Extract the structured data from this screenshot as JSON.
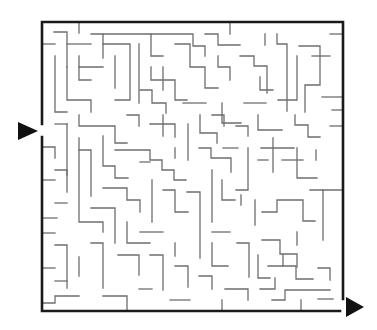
{
  "maze": {
    "title": "",
    "colors": {
      "wall": "#6e6e6e",
      "border": "#1a1a1a",
      "arrow": "#111111",
      "background": "#ffffff"
    },
    "entrance": {
      "icon": "arrow-right-icon",
      "points": "18,122 18,140 38,131"
    },
    "exit": {
      "icon": "arrow-right-icon",
      "points": "346,297 346,317 364,307"
    },
    "border": [
      "M42,124 L42,22 L343,22 L343,299",
      "M42,137 L42,311 L340,311"
    ],
    "walls": [
      "M54,32 L67,32 L67,67",
      "M42,44 L55,44",
      "M79,22 L79,33",
      "M67,44 L91,44",
      "M91,34 L193,34 L193,46 L205,46 L205,56",
      "M103,34 L103,58 M79,67 L103,67",
      "M55,56 L55,112 L67,112",
      "M67,67 L67,100 L91,100 L91,112",
      "M79,56 L79,80 L91,80",
      "M103,44 L130,44 L130,100 L115,100",
      "M115,56 L115,88",
      "M139,44 L139,103",
      "M151,34 L151,56 L163,56",
      "M163,67 L163,90",
      "M151,67 L151,80 L175,80 L175,100 L187,100",
      "M175,44 L190,44 L190,67 L205,67 L205,88 L218,88",
      "M218,56 L218,67 L230,67 L230,80",
      "M205,34 L218,34 L218,45 L240,45",
      "M230,22 L230,34",
      "M240,56 L254,56 L254,66 L267,66 L267,93",
      "M265,34 L265,45",
      "M277,34 L277,44 L287,44 L287,111",
      "M260,77 L260,90 L273,90",
      "M299,46 L320,46 L320,85 L305,85 L305,112",
      "M312,56 L330,56",
      "M330,34 L343,34",
      "M297,56 L297,100 L278,100",
      "M322,97 L343,97",
      "M332,110 L343,110",
      "M222,103 L222,123 L241,123",
      "M183,103 L206,103",
      "M244,103 L266,103",
      "M140,90 L152,90 L152,103 L166,103 L166,113",
      "M55,124 L67,124",
      "M67,124 L67,175",
      "M79,115 L79,126 L115,126 L115,143 L127,143",
      "M103,136 L103,166 L115,166 L115,178 L128,178",
      "M127,115 L139,115 L139,126",
      "M150,124 L175,124 L175,137",
      "M163,115 L163,136",
      "M188,124 L188,160",
      "M200,115 L200,133 L217,133 L217,143",
      "M212,115 L224,115 L224,126",
      "M236,126 L248,126 L248,136",
      "M258,115 L258,130 L282,130",
      "M295,115 L295,125 L308,125 L308,137 L320,137",
      "M330,126 L343,126",
      "M42,147 L55,147 L55,158",
      "M79,150 L91,150 L91,196",
      "M79,138 L79,222 L103,222 L103,232",
      "M55,170 L67,170 L67,192",
      "M103,188 L127,188 L127,200 L140,200 L140,212",
      "M115,150 L150,150 L150,160 L162,160 L162,170 L174,170 L174,180 L186,180",
      "M140,162 L150,162",
      "M199,148 L211,148 L211,158 L231,158 L231,172",
      "M175,148 L175,158",
      "M223,148 L238,148",
      "M248,148 L248,190 L236,190",
      "M261,148 L294,148",
      "M273,138 L273,172",
      "M258,160 L268,160",
      "M297,148 L297,178 L317,178",
      "M282,160 L303,160",
      "M316,160 L316,150",
      "M310,190 L343,190",
      "M42,180 L55,180",
      "M55,203 L67,203",
      "M42,218 L57,218",
      "M91,208 L115,208 L115,243",
      "M127,222 L127,243 L150,243",
      "M140,232 L163,232",
      "M152,180 L152,222",
      "M163,190 L175,190 L175,212 L188,212",
      "M187,192 L200,192 L200,258",
      "M212,170 L212,222",
      "M212,232 L230,232",
      "M222,180 L222,200 L235,200",
      "M241,195 L241,205",
      "M255,200 L255,225",
      "M262,212 L277,212 L277,200 L303,200 L303,221 L315,221",
      "M323,190 L323,240",
      "M297,232 L297,245",
      "M42,233 L55,233",
      "M55,245 L67,245 L67,288",
      "M91,243 L103,243 L103,288",
      "M79,257 L79,276",
      "M118,255 L139,255 L139,275",
      "M150,255 L163,255 L163,290",
      "M175,243 L175,256",
      "M175,266 L188,266 L188,287",
      "M212,243 L212,266 L228,266",
      "M237,243 L249,243 L249,277",
      "M42,268 L55,268",
      "M55,281 L67,281",
      "M42,303 L55,303 L55,296 L79,296",
      "M103,296 L127,296 L127,311",
      "M139,289 L152,289",
      "M199,276 L212,276 L212,289",
      "M225,289 L248,289 L248,300",
      "M262,240 L280,240 L280,254 L297,254 L297,267",
      "M258,255 L258,278 L270,278",
      "M268,266 L296,266 L296,279 L313,279",
      "M283,266 L283,255",
      "M260,289 L275,289 L275,278",
      "M272,300 L285,300 L285,290 L330,290",
      "M318,268 L330,268 L330,280",
      "M301,311 L301,300",
      "M318,299 L333,299",
      "M222,300 L222,311",
      "M170,300 L190,300"
    ]
  }
}
